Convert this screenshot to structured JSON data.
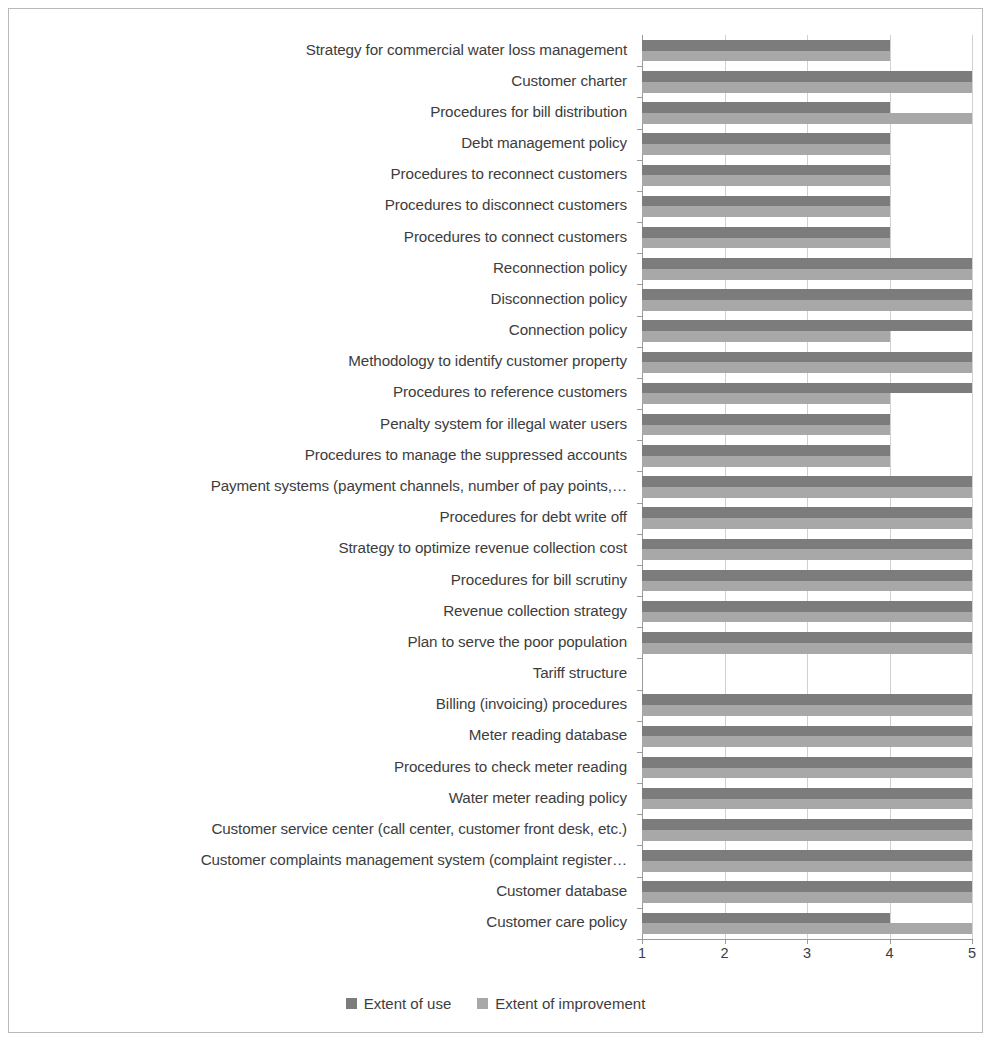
{
  "chart_data": {
    "type": "bar",
    "orientation": "horizontal",
    "title": "",
    "subtitle": "",
    "xlabel": "",
    "ylabel": "",
    "xlim": [
      1,
      5
    ],
    "xticks": [
      1,
      2,
      3,
      4,
      5
    ],
    "xtick_labels": [
      "1",
      "2",
      "3",
      "4",
      "5"
    ],
    "grid": true,
    "grid_axis": "x",
    "legend_position": "bottom",
    "legend_entries": [
      "Extent of use",
      "Extent of improvement"
    ],
    "colors": {
      "extent_of_use": "#7c7c7c",
      "extent_of_improvement": "#a8a8a8",
      "gridline": "#d0d0d0",
      "axis": "#9a9a9a",
      "border": "#b9b9b9",
      "text": "#3d3d3d",
      "background": "#ffffff"
    },
    "categories": [
      "Strategy for commercial water loss management",
      "Customer charter",
      "Procedures for bill distribution",
      "Debt management policy",
      "Procedures to reconnect customers",
      "Procedures to disconnect customers",
      "Procedures to connect customers",
      "Reconnection policy",
      "Disconnection policy",
      "Connection policy",
      "Methodology to identify customer property",
      "Procedures to reference customers",
      "Penalty system  for illegal water users",
      "Procedures to manage the suppressed accounts",
      "Payment systems (payment channels, number of pay points,…",
      "Procedures for debt write off",
      "Strategy to optimize revenue collection cost",
      "Procedures for bill scrutiny",
      "Revenue collection strategy",
      "Plan to serve the poor population",
      "Tariff structure",
      "Billing (invoicing) procedures",
      "Meter reading database",
      "Procedures to check meter reading",
      "Water meter reading policy",
      "Customer service center (call center, customer front desk, etc.)",
      "Customer complaints management system (complaint register…",
      "Customer database",
      "Customer care policy"
    ],
    "series": [
      {
        "name": "Extent of use",
        "color": "#7c7c7c",
        "values": [
          4,
          5,
          4,
          4,
          4,
          4,
          4,
          5,
          5,
          5,
          5,
          5,
          4,
          4,
          5,
          5,
          5,
          5,
          5,
          5,
          1,
          5,
          5,
          5,
          5,
          5,
          5,
          5,
          4
        ]
      },
      {
        "name": "Extent of improvement",
        "color": "#a8a8a8",
        "values": [
          4,
          5,
          5,
          4,
          4,
          4,
          4,
          5,
          5,
          4,
          5,
          4,
          4,
          4,
          5,
          5,
          5,
          5,
          5,
          5,
          1,
          5,
          5,
          5,
          5,
          5,
          5,
          5,
          5
        ]
      }
    ]
  }
}
